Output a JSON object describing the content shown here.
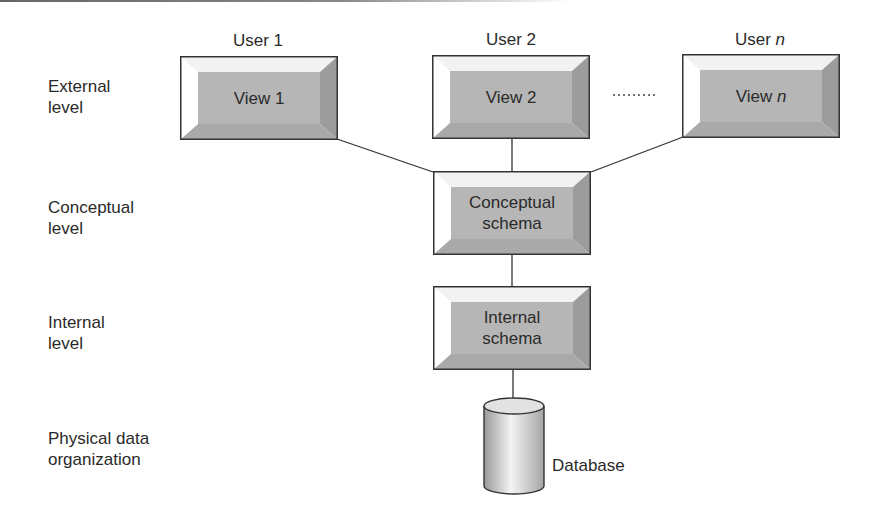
{
  "levels": [
    {
      "label_line1": "External",
      "label_line2": "level"
    },
    {
      "label_line1": "Conceptual",
      "label_line2": "level"
    },
    {
      "label_line1": "Internal",
      "label_line2": "level"
    },
    {
      "label_line1": "Physical data",
      "label_line2": "organization"
    }
  ],
  "users": [
    {
      "prefix": "User",
      "suffix": "1",
      "suffix_italic": false
    },
    {
      "prefix": "User",
      "suffix": "2",
      "suffix_italic": false
    },
    {
      "prefix": "User",
      "suffix": "n",
      "suffix_italic": true
    }
  ],
  "views": [
    {
      "prefix": "View",
      "suffix": "1"
    },
    {
      "prefix": "View",
      "suffix": "2"
    },
    {
      "prefix": "View",
      "suffix": "n"
    }
  ],
  "ellipsis": "..........",
  "conceptual_schema": {
    "line1": "Conceptual",
    "line2": "schema"
  },
  "internal_schema": {
    "line1": "Internal",
    "line2": "schema"
  },
  "database": {
    "label": "Database"
  },
  "colors": {
    "box_face": "#b4b4b4",
    "bevel_top": "#f4f4f4",
    "bevel_left": "#ffffff",
    "bevel_right": "#9a9a9a",
    "bevel_bottom": "#a8a8a8",
    "outline": "#333333",
    "line": "#333333"
  }
}
